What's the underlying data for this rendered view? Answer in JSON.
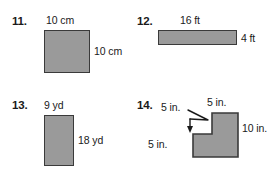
{
  "page": {
    "background_color": "#ffffff",
    "shape_fill_color": "#9a9a9a",
    "shape_border_color": "#3a3a3a",
    "text_color": "#1a1a1a"
  },
  "problems": [
    {
      "number": "11.",
      "figure": "square",
      "labels": {
        "top": "10 cm",
        "right": "10 cm"
      }
    },
    {
      "number": "12.",
      "figure": "rectangle-wide",
      "labels": {
        "top": "16 ft",
        "right": "4 ft"
      }
    },
    {
      "number": "13.",
      "figure": "rectangle-tall",
      "labels": {
        "top": "9 yd",
        "right": "18 yd"
      }
    },
    {
      "number": "14.",
      "figure": "l-shape",
      "labels": {
        "notch_top": "5 in.",
        "top_right": "5 in.",
        "bottom_left": "5 in.",
        "right": "10 in."
      }
    }
  ]
}
